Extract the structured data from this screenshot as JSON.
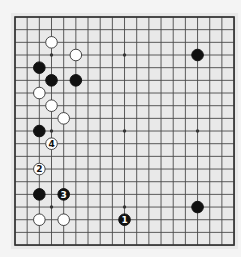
{
  "diagram": {
    "type": "go-board",
    "size": 19,
    "geometry": {
      "x0": 15,
      "y0": 17,
      "dx": 12.17,
      "dy": 12.67
    },
    "colors": {
      "page_background": "#f4f4f4",
      "board_background": "#e9e9e9",
      "grid_line": "#4a4a4a",
      "border": "#333333",
      "black_stone": "#111111",
      "white_stone": "#ffffff",
      "white_stone_outline": "#333333"
    },
    "star_points": [
      [
        3,
        3
      ],
      [
        9,
        3
      ],
      [
        15,
        3
      ],
      [
        3,
        9
      ],
      [
        9,
        9
      ],
      [
        15,
        9
      ],
      [
        3,
        15
      ],
      [
        9,
        15
      ],
      [
        15,
        15
      ]
    ],
    "stones": [
      {
        "color": "white",
        "col": 3,
        "row": 2,
        "label": ""
      },
      {
        "color": "white",
        "col": 5,
        "row": 3,
        "label": ""
      },
      {
        "color": "black",
        "col": 15,
        "row": 3,
        "label": ""
      },
      {
        "color": "black",
        "col": 2,
        "row": 4,
        "label": ""
      },
      {
        "color": "black",
        "col": 3,
        "row": 5,
        "label": ""
      },
      {
        "color": "black",
        "col": 5,
        "row": 5,
        "label": ""
      },
      {
        "color": "white",
        "col": 2,
        "row": 6,
        "label": ""
      },
      {
        "color": "white",
        "col": 3,
        "row": 7,
        "label": ""
      },
      {
        "color": "white",
        "col": 4,
        "row": 8,
        "label": ""
      },
      {
        "color": "black",
        "col": 2,
        "row": 9,
        "label": ""
      },
      {
        "color": "white",
        "col": 3,
        "row": 10,
        "label": "4"
      },
      {
        "color": "white",
        "col": 2,
        "row": 12,
        "label": "2"
      },
      {
        "color": "black",
        "col": 2,
        "row": 14,
        "label": ""
      },
      {
        "color": "black",
        "col": 4,
        "row": 14,
        "label": "3"
      },
      {
        "color": "black",
        "col": 15,
        "row": 15,
        "label": ""
      },
      {
        "color": "white",
        "col": 2,
        "row": 16,
        "label": ""
      },
      {
        "color": "white",
        "col": 4,
        "row": 16,
        "label": ""
      },
      {
        "color": "black",
        "col": 9,
        "row": 16,
        "label": "1"
      }
    ],
    "move_sequence": [
      {
        "move": "1",
        "color": "black",
        "col": 9,
        "row": 16
      },
      {
        "move": "2",
        "color": "white",
        "col": 2,
        "row": 12
      },
      {
        "move": "3",
        "color": "black",
        "col": 4,
        "row": 14
      },
      {
        "move": "4",
        "color": "white",
        "col": 3,
        "row": 10
      }
    ]
  }
}
